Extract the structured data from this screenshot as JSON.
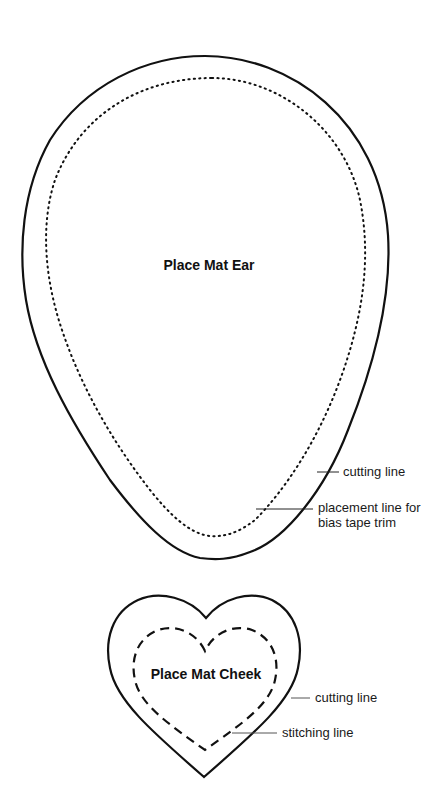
{
  "ear": {
    "title": "Place Mat Ear",
    "cutting_label": "cutting line",
    "placement_label_line1": "placement line for",
    "placement_label_line2": "bias tape trim"
  },
  "cheek": {
    "title": "Place Mat Cheek",
    "cutting_label": "cutting line",
    "stitching_label": "stitching line"
  },
  "colors": {
    "line": "#111111",
    "background": "#ffffff"
  }
}
